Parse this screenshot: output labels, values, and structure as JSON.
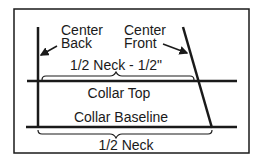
{
  "diagram": {
    "labels": {
      "center_back_line1": "Center",
      "center_back_line2": "Back",
      "center_front_line1": "Center",
      "center_front_line2": "Front",
      "top_measure": "1/2 Neck - 1/2\"",
      "collar_top": "Collar Top",
      "collar_baseline": "Collar Baseline",
      "bottom_measure": "1/2 Neck"
    },
    "colors": {
      "ink": "#1a1a1a",
      "background": "#ffffff"
    }
  }
}
